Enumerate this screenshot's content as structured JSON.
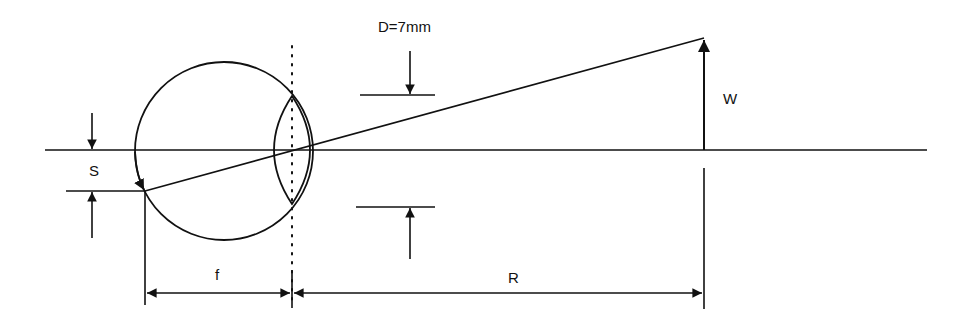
{
  "diagram": {
    "colors": {
      "stroke": "#111111",
      "background": "#ffffff"
    },
    "labels": {
      "pupil_diameter": "D=7mm",
      "object_size": "W",
      "image_size": "S",
      "focal_length": "f",
      "distance": "R"
    },
    "elements": [
      {
        "id": "optical-axis",
        "type": "line",
        "description": "horizontal optical axis"
      },
      {
        "id": "eyeball",
        "type": "circle"
      },
      {
        "id": "lens",
        "type": "biconvex-lens"
      },
      {
        "id": "lens-plane",
        "type": "dotted-line"
      },
      {
        "id": "chief-ray",
        "type": "line",
        "description": "ray from object top through lens center to retina"
      },
      {
        "id": "object-arrow",
        "type": "arrow",
        "label": "W"
      },
      {
        "id": "image-arrow",
        "type": "arrow",
        "label": "S"
      },
      {
        "id": "pupil-dimension",
        "type": "dimension",
        "label": "D=7mm"
      },
      {
        "id": "focal-dimension",
        "type": "dimension",
        "label": "f"
      },
      {
        "id": "distance-dimension",
        "type": "dimension",
        "label": "R"
      }
    ]
  }
}
